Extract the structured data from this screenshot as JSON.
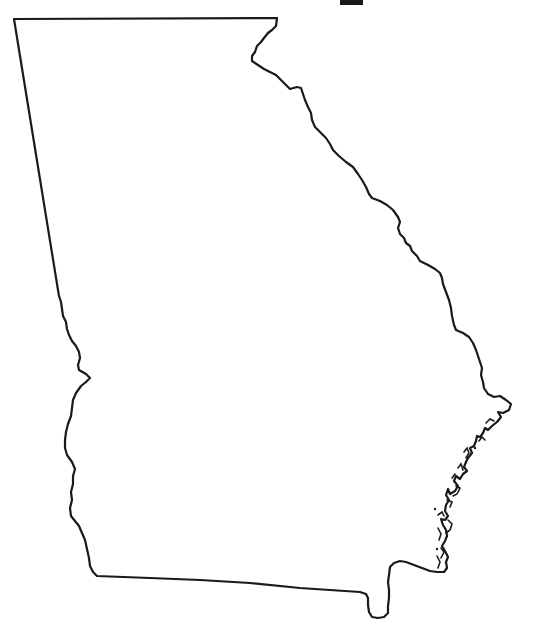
{
  "map": {
    "subject": "Georgia state outline",
    "style": "blank outline",
    "stroke_color": "#1a1a1a",
    "fill_color": "#ffffff",
    "background_color": "#ffffff",
    "stroke_width": 2.2
  },
  "labels": {
    "title": ""
  },
  "artifacts": {
    "top_bar_color": "#1a1a1a"
  }
}
